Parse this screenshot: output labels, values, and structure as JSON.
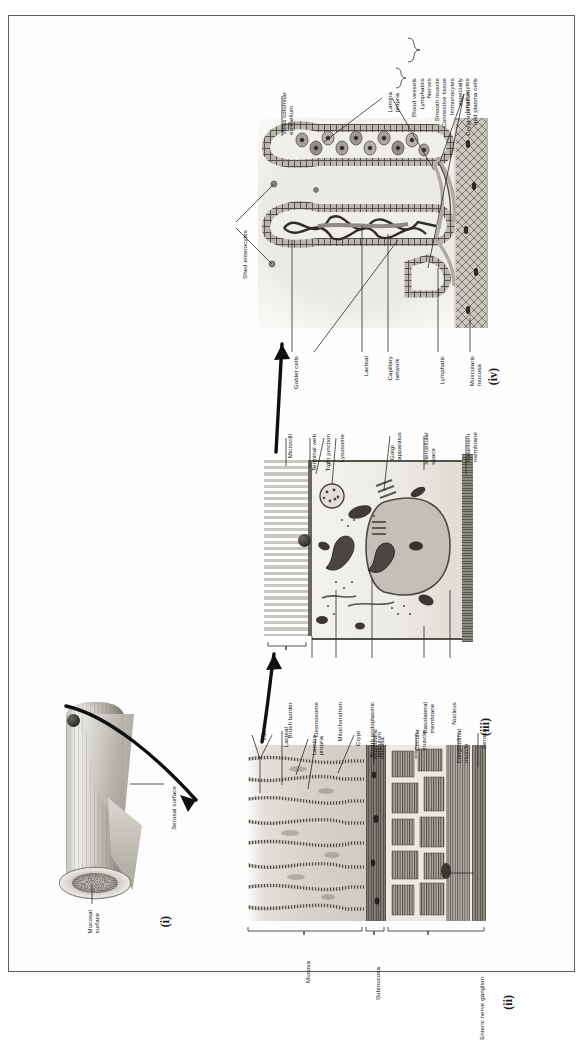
{
  "figure": {
    "panel_markers": {
      "i": "(i)",
      "ii": "(ii)",
      "iii": "(iii)",
      "iv": "(iv)"
    },
    "ink": "#141414",
    "paper": "#ffffff",
    "border_color": "#5d5d5d"
  },
  "panel_i": {
    "marker": "(i)",
    "labels": {
      "serosal_surface": "Serosal surface",
      "mucosal_surface": "Mucosal\nsurface"
    }
  },
  "panel_ii": {
    "marker": "(ii)",
    "labels": {
      "lacteal": "Lacteal",
      "villi": "Villi",
      "lamina_propria": "Lamina\npropria",
      "crypt": "Crypt",
      "muscularis_mucosa": "Muscularis\nmucosa",
      "circular_muscle": "Circular\nmuscle",
      "longitudinal_muscle": "Longitudinal\nmuscle",
      "serosa": "Serosa",
      "enteric_nerve_ganglion": "Enteric nerve ganglion"
    },
    "braces": {
      "mucosa": "Mucosa",
      "submucosa": "Submucosa"
    }
  },
  "panel_iii": {
    "marker": "(iii)",
    "labels_top": {
      "microvilli": "Microvilli",
      "terminal_web": "Terminal web",
      "tight_junction": "Tight junction",
      "lysosome": "Lysosome",
      "golgi_apparatus": "Golgi\napparatus",
      "intercellular_space": "Intercellular\nspace",
      "basement_membrane": "Basement\nmembrane"
    },
    "labels_bottom": {
      "brush_border": "Brush border",
      "desmosome": "Desmosome",
      "mitochondrion": "Mitochondrion",
      "rough_endoplasmic_reticulum": "Rough endoplasmic\nreticulum",
      "basolateral_membrane": "Basolateral\nmembrane",
      "nucleus": "Nucleus"
    }
  },
  "panel_iv": {
    "marker": "(iv)",
    "labels": {
      "villus_columnar_epithelium": "Villus columnar\nepithelium",
      "lamina_propria": "Lamina\npropria",
      "crypt_epithelium": "Crypt epithelium",
      "shed_enterocytes": "Shed enterocytes",
      "goblet_cells": "Goblet cells",
      "lacteal": "Lacteal",
      "capillary_network": "Capillary\nnetwork",
      "lymphatic": "Lymphatic",
      "muscularis_mucosa": "Muscularis\nmucosa"
    },
    "lamina_propria_contents": [
      "Blood vessels",
      "Lymphatics",
      "Nerves",
      "Smooth muscle",
      "Connective tissue",
      "Immunocytes",
      "especially",
      "lymphocytes",
      "and plasma cells"
    ]
  }
}
